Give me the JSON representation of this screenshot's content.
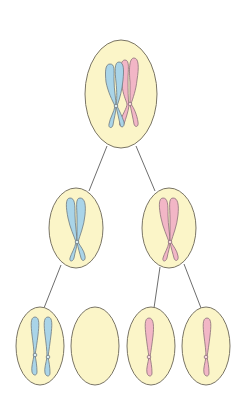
{
  "diagram": {
    "colors": {
      "background": "#ffffff",
      "cell_fill": "#fbf5c8",
      "cell_stroke": "#7a7565",
      "line": "#6e6e6e",
      "chromosome_blue": "#a9d4e8",
      "chromosome_pink": "#f2b6c6",
      "chromosome_stroke": "#6f7a80"
    },
    "cells": [
      {
        "id": "parent",
        "level": 0,
        "cx": 121,
        "cy": 94,
        "rx": 36,
        "ry": 54,
        "chromosomes": [
          "blue-replicated",
          "pink-replicated"
        ]
      },
      {
        "id": "meiosis1-left",
        "level": 1,
        "cx": 76,
        "cy": 228,
        "rx": 27,
        "ry": 40,
        "chromosomes": [
          "blue-replicated"
        ]
      },
      {
        "id": "meiosis1-right",
        "level": 1,
        "cx": 169,
        "cy": 228,
        "rx": 27,
        "ry": 40,
        "chromosomes": [
          "pink-replicated"
        ]
      },
      {
        "id": "gamete-1",
        "level": 2,
        "cx": 40,
        "cy": 346,
        "rx": 24,
        "ry": 39,
        "chromosomes": [
          "blue-chromatid",
          "blue-chromatid"
        ]
      },
      {
        "id": "gamete-2",
        "level": 2,
        "cx": 95,
        "cy": 346,
        "rx": 24,
        "ry": 39,
        "chromosomes": []
      },
      {
        "id": "gamete-3",
        "level": 2,
        "cx": 151,
        "cy": 346,
        "rx": 24,
        "ry": 39,
        "chromosomes": [
          "pink-chromatid"
        ]
      },
      {
        "id": "gamete-4",
        "level": 2,
        "cx": 206,
        "cy": 346,
        "rx": 24,
        "ry": 39,
        "chromosomes": [
          "pink-chromatid"
        ]
      }
    ],
    "connectors": [
      {
        "from": "parent",
        "to": "meiosis1-left"
      },
      {
        "from": "parent",
        "to": "meiosis1-right"
      },
      {
        "from": "meiosis1-left",
        "to": "gamete-1"
      },
      {
        "from": "meiosis1-right",
        "to": "gamete-3"
      },
      {
        "from": "meiosis1-right",
        "to": "gamete-4"
      }
    ]
  }
}
